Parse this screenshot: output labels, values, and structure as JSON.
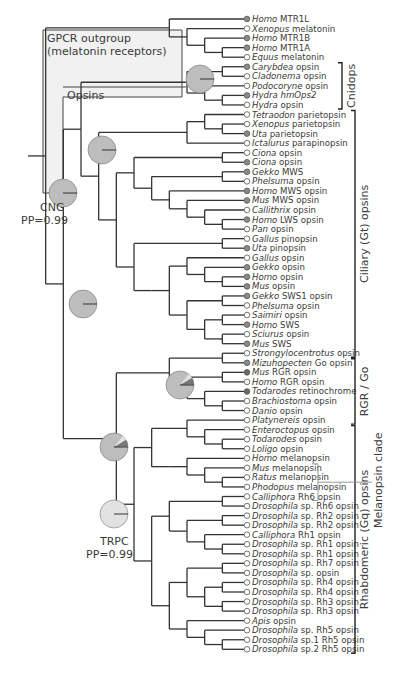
{
  "figure": {
    "type": "phylogenetic-tree",
    "boxes": {
      "gpcr_outgroup": {
        "line1": "GPCR outgroup",
        "line2": "(melatonin receptors)"
      },
      "opsins": {
        "label": "Opsins"
      }
    },
    "node_labels": {
      "cng": {
        "name": "CNG",
        "pp": "PP=0.99"
      },
      "trpc": {
        "name": "TRPC",
        "pp": "PP=0.99"
      }
    },
    "clades": [
      {
        "id": "cnidops",
        "label": "Cnidops",
        "from": 5,
        "to": 9
      },
      {
        "id": "ciliary",
        "label": "Ciliary (Gt) opsins",
        "from": 10,
        "to": 35
      },
      {
        "id": "rgr_go",
        "label": "RGR / Go",
        "from": 36,
        "to": 42
      },
      {
        "id": "rhabdomeric",
        "label": "Rhabdomeric (Gq) opsins",
        "from": 43,
        "to": 66
      },
      {
        "id": "melanopsin",
        "label": "Melanopsin clade",
        "from": 47,
        "to": 50
      }
    ],
    "colors": {
      "filled_marker": "#8a8a8a",
      "dark_marker": "#6a6a6a",
      "open_marker": "#ffffff",
      "pie_main": "#bdbdbd",
      "pie_light": "#e2e2e2",
      "pie_dark": "#777777",
      "box_fill": "#f1f1f1"
    },
    "leaves": [
      {
        "genus": "Homo",
        "rest": " MTR1L",
        "marker": "filled"
      },
      {
        "genus": "Xenopus",
        "rest": " melatonin",
        "marker": "open"
      },
      {
        "genus": "Homo",
        "rest": " MTR1B",
        "marker": "filled"
      },
      {
        "genus": "Homo",
        "rest": " MTR1A",
        "marker": "filled"
      },
      {
        "genus": "Equus",
        "rest": " melatonin",
        "marker": "open"
      },
      {
        "genus": "Carybdea",
        "rest": " opsin",
        "marker": "filled"
      },
      {
        "genus": "Cladonema",
        "rest": " opsin",
        "marker": "open"
      },
      {
        "genus": "Podocoryne",
        "rest": " opsin",
        "marker": "open"
      },
      {
        "genus": "Hydra hmOps2",
        "rest": "",
        "marker": "filled"
      },
      {
        "genus": "Hydra",
        "rest": " opsin",
        "marker": "open"
      },
      {
        "genus": "Tetraodon",
        "rest": " parietopsin",
        "marker": "open"
      },
      {
        "genus": "Xenopus",
        "rest": " parietopsin",
        "marker": "open"
      },
      {
        "genus": "Uta",
        "rest": " parietopsin",
        "marker": "filled"
      },
      {
        "genus": "Ictalurus",
        "rest": " parapinopsin",
        "marker": "open"
      },
      {
        "genus": "Ciona",
        "rest": " opsin",
        "marker": "open"
      },
      {
        "genus": "Ciona",
        "rest": " opsin",
        "marker": "filled"
      },
      {
        "genus": "Gekko",
        "rest": " MWS",
        "marker": "filled"
      },
      {
        "genus": "Phelsuma",
        "rest": " opsin",
        "marker": "open"
      },
      {
        "genus": "Homo",
        "rest": " MWS opsin",
        "marker": "filled"
      },
      {
        "genus": "Mus",
        "rest": " MWS opsin",
        "marker": "filled"
      },
      {
        "genus": "Callithrix",
        "rest": " opsin",
        "marker": "open"
      },
      {
        "genus": "Homo",
        "rest": " LWS opsin",
        "marker": "filled"
      },
      {
        "genus": "Pan",
        "rest": " opsin",
        "marker": "open"
      },
      {
        "genus": "Gallus",
        "rest": " pinopsin",
        "marker": "open"
      },
      {
        "genus": "Uta",
        "rest": " pinopsin",
        "marker": "filled"
      },
      {
        "genus": "Gallus",
        "rest": " opsin",
        "marker": "open"
      },
      {
        "genus": "Gekko",
        "rest": " opsin",
        "marker": "filled"
      },
      {
        "genus": "Homo",
        "rest": " opsin",
        "marker": "filled"
      },
      {
        "genus": "Mus",
        "rest": " opsin",
        "marker": "filled"
      },
      {
        "genus": "Gekko",
        "rest": " SWS1 opsin",
        "marker": "filled"
      },
      {
        "genus": "Phelsuma",
        "rest": " opsin",
        "marker": "open"
      },
      {
        "genus": "Saimiri",
        "rest": " opsin",
        "marker": "open"
      },
      {
        "genus": "Homo",
        "rest": " SWS",
        "marker": "filled"
      },
      {
        "genus": "Sciurus",
        "rest": " opsin",
        "marker": "open"
      },
      {
        "genus": "Mus",
        "rest": " SWS",
        "marker": "filled"
      },
      {
        "genus": "Strongylocentrotus",
        "rest": " opsin",
        "marker": "open"
      },
      {
        "genus": "Mizuhopecten",
        "rest": " Go opsin",
        "marker": "filled"
      },
      {
        "genus": "Mus",
        "rest": " RGR opsin",
        "marker": "dark"
      },
      {
        "genus": "Homo",
        "rest": " RGR opsin",
        "marker": "open"
      },
      {
        "genus": "Todarodes",
        "rest": " retinochrome",
        "marker": "dark"
      },
      {
        "genus": "Brachiostoma",
        "rest": " opsin",
        "marker": "open"
      },
      {
        "genus": "Danio",
        "rest": " opsin",
        "marker": "open"
      },
      {
        "genus": "Platynereis",
        "rest": " opsin",
        "marker": "open"
      },
      {
        "genus": "Enteroctopus",
        "rest": " opsin",
        "marker": "open"
      },
      {
        "genus": "Todarodes",
        "rest": " opsin",
        "marker": "open"
      },
      {
        "genus": "Loligo",
        "rest": " opsin",
        "marker": "open"
      },
      {
        "genus": "Homo",
        "rest": " melanopsin",
        "marker": "open"
      },
      {
        "genus": "Mus",
        "rest": " melanopsin",
        "marker": "open"
      },
      {
        "genus": "Ratus",
        "rest": " melanopsin",
        "marker": "open"
      },
      {
        "genus": "Phodopus",
        "rest": " melanopsin",
        "marker": "open"
      },
      {
        "genus": "Calliphora",
        "rest": " Rh6 opsin",
        "marker": "open"
      },
      {
        "genus": "Drosophila",
        "rest": " sp. Rh6 opsin",
        "marker": "open"
      },
      {
        "genus": "Drosophila",
        "rest": " sp. Rh2 opsin",
        "marker": "open"
      },
      {
        "genus": "Drosophila",
        "rest": " sp. Rh2 opsin",
        "marker": "open"
      },
      {
        "genus": "Calliphora",
        "rest": " Rh1 opsin",
        "marker": "open"
      },
      {
        "genus": "Drosophila",
        "rest": " sp. Rh1 opsin",
        "marker": "open"
      },
      {
        "genus": "Drosophila",
        "rest": " sp. Rh1 opsin",
        "marker": "open"
      },
      {
        "genus": "Drosophila",
        "rest": " sp. Rh7 opsin",
        "marker": "open"
      },
      {
        "genus": "Drosophila",
        "rest": " sp. opsin",
        "marker": "open"
      },
      {
        "genus": "Drosophila",
        "rest": " sp. Rh4 opsin",
        "marker": "open"
      },
      {
        "genus": "Drosophila",
        "rest": " sp. Rh4 opsin",
        "marker": "open"
      },
      {
        "genus": "Drosophila",
        "rest": " sp. Rh3 opsin",
        "marker": "open"
      },
      {
        "genus": "Drosophila",
        "rest": " sp. Rh3 opsin",
        "marker": "open"
      },
      {
        "genus": "Apis",
        "rest": " opsin",
        "marker": "open"
      },
      {
        "genus": "Drosophila",
        "rest": " sp. Rh5 opsin",
        "marker": "open"
      },
      {
        "genus": "Drosophila",
        "rest": " sp.1 Rh5 opsin",
        "marker": "open"
      },
      {
        "genus": "Drosophila",
        "rest": " sp.2 Rh5 opsin",
        "marker": "open"
      }
    ],
    "tree": "(((0,(1,(2,(3,4)))),((((5,6),(7,(8,9))),(((10,(11,12)),13),(((14,15),((16,17),(18,(19,(20,(21,22)))))),((23,24),(((25,(26,(27,28))),((29,30),((31,32),(33,34))))))))),(((35,36),((37,38),(39,(40,41)))),(((42,(43,(44,45))),((46,(47,(48,49))))),(((50,51),((52,53),(54,(55,56)))),(((57,58),((59,60),(61,62))),(63,(64,(65,66)))))))))))",
    "pie_nodes": [
      {
        "id": "cnidops-node",
        "cx": 200,
        "cy": 79,
        "r": 14,
        "slices": []
      },
      {
        "id": "cng-node",
        "cx": 63,
        "cy": 193,
        "r": 14,
        "slices": []
      },
      {
        "id": "ciliary-node",
        "cx": 102,
        "cy": 150,
        "r": 14,
        "slices": []
      },
      {
        "id": "opsin-core-node",
        "cx": 83,
        "cy": 304,
        "r": 14,
        "slices": []
      },
      {
        "id": "rgr-go-node",
        "cx": 180,
        "cy": 385,
        "r": 14,
        "slices": [
          "dark-wedge",
          "light-wedge"
        ]
      },
      {
        "id": "rhab-rgr-node",
        "cx": 114,
        "cy": 447,
        "r": 14,
        "slices": [
          "dark-wedge",
          "light-wedge"
        ]
      },
      {
        "id": "trpc-node",
        "cx": 114,
        "cy": 514,
        "r": 14,
        "slices": [
          "light-fill"
        ]
      }
    ]
  }
}
